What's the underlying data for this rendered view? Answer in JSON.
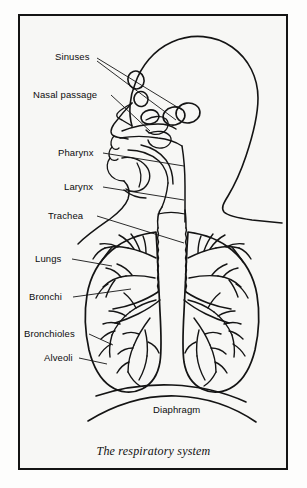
{
  "figure": {
    "caption": "The respiratory system",
    "background_color": "#f7f7f5",
    "line_color": "#141414",
    "frame_color": "#141414"
  },
  "labels": [
    {
      "id": "sinuses",
      "text": "Sinuses",
      "x": 55,
      "y": 56
    },
    {
      "id": "nasal",
      "text": "Nasal passage",
      "x": 33,
      "y": 94
    },
    {
      "id": "pharynx",
      "text": "Pharynx",
      "x": 58,
      "y": 152
    },
    {
      "id": "larynx",
      "text": "Larynx",
      "x": 64,
      "y": 186
    },
    {
      "id": "trachea",
      "text": "Trachea",
      "x": 48,
      "y": 214
    },
    {
      "id": "lungs",
      "text": "Lungs",
      "x": 35,
      "y": 258
    },
    {
      "id": "bronchi",
      "text": "Bronchi",
      "x": 29,
      "y": 296
    },
    {
      "id": "bronchioles",
      "text": "Bronchioles",
      "x": 24,
      "y": 333
    },
    {
      "id": "alveoli",
      "text": "Alveoli",
      "x": 44,
      "y": 357
    },
    {
      "id": "diaphragm",
      "text": "Diaphragm",
      "x": 153,
      "y": 409
    }
  ]
}
